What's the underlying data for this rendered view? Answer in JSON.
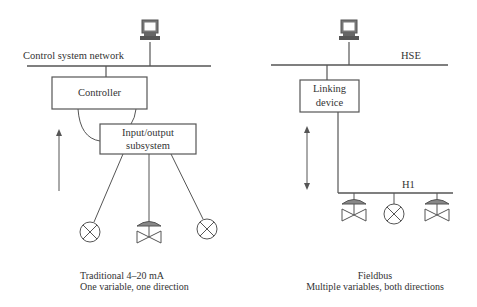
{
  "left_diagram": {
    "network_label": "Control system network",
    "controller_label": "Controller",
    "io_label_line1": "Input/output",
    "io_label_line2": "subsystem",
    "caption_line1": "Traditional 4–20 mA",
    "caption_line2": "One variable, one direction",
    "field_devices": [
      "transmitter-icon",
      "valve-icon",
      "transmitter-icon"
    ],
    "arrow": "up-arrow-icon"
  },
  "right_diagram": {
    "network_label": "HSE",
    "linking_label_line1": "Linking",
    "linking_label_line2": "device",
    "bus_label": "H1",
    "caption_line1": "Fieldbus",
    "caption_line2": "Multiple variables, both directions",
    "field_devices": [
      "valve-icon",
      "transmitter-icon",
      "valve-icon"
    ],
    "arrow": "double-arrow-icon"
  },
  "colors": {
    "line": "#555555",
    "computer": "#666666",
    "text": "#333333"
  }
}
